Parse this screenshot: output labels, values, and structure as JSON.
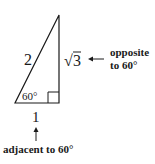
{
  "diagram": {
    "type": "right-triangle",
    "hypotenuse_label": "2",
    "opposite_label": "3",
    "opposite_radical": "√",
    "adjacent_label": "1",
    "angle_label": "60°",
    "opposite_caption_line1": "opposite",
    "opposite_caption_line2": "to 60°",
    "adjacent_caption": "adjacent to 60°",
    "colors": {
      "stroke": "#1a1a1a",
      "background": "#ffffff"
    }
  }
}
